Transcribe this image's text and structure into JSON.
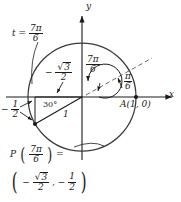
{
  "figure": {
    "axes": {
      "x_label": "x",
      "y_label": "y"
    },
    "point_A": "A(1, 0)",
    "parameter_label": {
      "prefix": "t =",
      "numerator": "7π",
      "denominator": "6"
    },
    "arc_label": {
      "numerator": "7π",
      "denominator": "6"
    },
    "reference_dashed_label": {
      "numerator": "π",
      "denominator": "6"
    },
    "x_coordinate_label": {
      "sign": "−",
      "numerator": "√3",
      "radicand": "3",
      "denominator": "2"
    },
    "y_coordinate_label": {
      "sign": "−",
      "numerator": "1",
      "denominator": "2"
    },
    "reference_angle": "30°",
    "radius_label": "1",
    "result": {
      "function_name": "P",
      "argument_numerator": "7π",
      "argument_denominator": "6",
      "equals": "=",
      "x_sign": "−",
      "x_numerator": "√3",
      "x_radicand": "3",
      "x_denominator": "2",
      "separator": ",",
      "y_sign": "−",
      "y_numerator": "1",
      "y_denominator": "2"
    },
    "colors": {
      "stroke": "#1a1a1a",
      "background": "#ffffff"
    },
    "geometry": {
      "center_x": 82,
      "center_y": 97,
      "radius": 54,
      "terminal_point_x": 35,
      "terminal_point_y": 124,
      "angle_degrees": 210
    }
  }
}
